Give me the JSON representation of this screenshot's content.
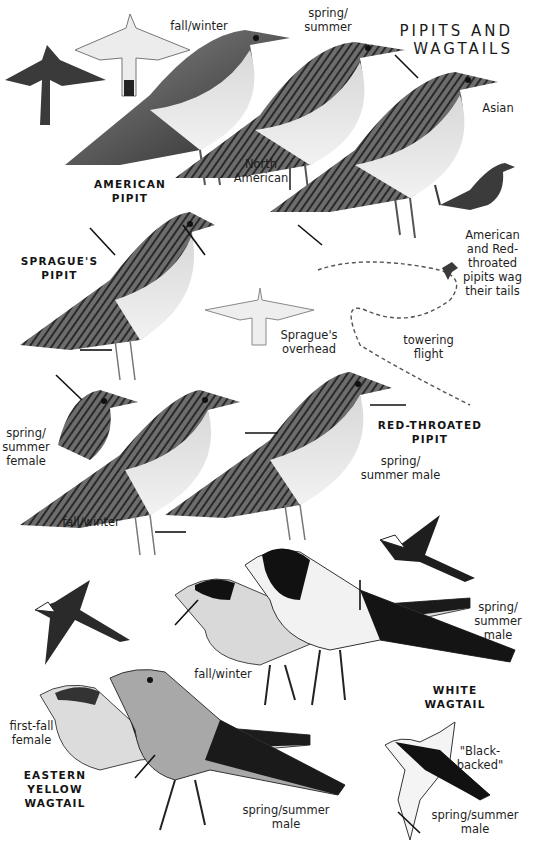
{
  "plate": {
    "title": "PIPITS AND\nWAGTAILS",
    "background": "#ffffff",
    "ink": "#1a1a1a"
  },
  "species": [
    {
      "id": "american-pipit",
      "name": "AMERICAN\nPIPIT",
      "labels": [
        "fall/winter",
        "spring/\nsummer",
        "North\nAmerican",
        "Asian"
      ],
      "notes": [
        "American\nand Red-\nthroated\npipits wag\ntheir tails"
      ]
    },
    {
      "id": "spragues-pipit",
      "name": "SPRAGUE'S\nPIPIT",
      "labels": [
        "Sprague's\noverhead",
        "towering\nflight"
      ]
    },
    {
      "id": "red-throated-pipit",
      "name": "RED-THROATED\nPIPIT",
      "labels": [
        "spring/\nsummer male",
        "spring/\nsummer\nfemale",
        "fall/winter"
      ]
    },
    {
      "id": "white-wagtail",
      "name": "WHITE\nWAGTAIL",
      "labels": [
        "spring/\nsummer\nmale",
        "fall/winter",
        "\"Black-\nbacked\"",
        "spring/summer\nmale"
      ]
    },
    {
      "id": "eastern-yellow-wagtail",
      "name": "EASTERN\nYELLOW\nWAGTAIL",
      "labels": [
        "first-fall\nfemale",
        "spring/summer\nmale"
      ]
    }
  ]
}
